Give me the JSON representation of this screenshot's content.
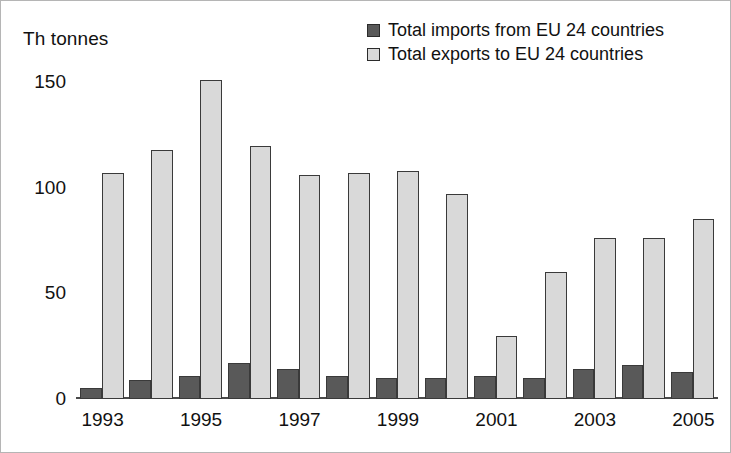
{
  "unit_label": "Th tonnes",
  "legend": {
    "position": "top-right",
    "items": [
      {
        "label": "Total imports from EU 24 countries",
        "color": "#595959",
        "key": "imports"
      },
      {
        "label": "Total exports to EU 24 countries",
        "color": "#d9d9d9",
        "key": "exports"
      }
    ]
  },
  "axes": {
    "y_ticks": [
      "0",
      "50",
      "100",
      "150"
    ],
    "x_ticks": [
      "1993",
      "1995",
      "1997",
      "1999",
      "2001",
      "2003",
      "2005"
    ]
  },
  "chart_data": {
    "type": "bar",
    "title": "",
    "subtitle": "",
    "xlabel": "",
    "ylabel": "Th tonnes",
    "ylim": [
      0,
      160
    ],
    "yticks": [
      0,
      50,
      100,
      150
    ],
    "grid": false,
    "legend_position": "top-right",
    "categories": [
      "1993",
      "1994",
      "1995",
      "1996",
      "1997",
      "1998",
      "1999",
      "2000",
      "2001",
      "2002",
      "2003",
      "2004",
      "2005"
    ],
    "tick_categories": [
      "1993",
      "1995",
      "1997",
      "1999",
      "2001",
      "2003",
      "2005"
    ],
    "series": [
      {
        "name": "Total imports from EU 24 countries",
        "color": "#595959",
        "values": [
          5,
          9,
          11,
          17,
          14,
          11,
          10,
          10,
          11,
          10,
          14,
          16,
          13
        ]
      },
      {
        "name": "Total exports to EU 24 countries",
        "color": "#d9d9d9",
        "values": [
          107,
          118,
          151,
          120,
          106,
          107,
          108,
          97,
          30,
          60,
          76,
          76,
          85
        ]
      }
    ]
  }
}
